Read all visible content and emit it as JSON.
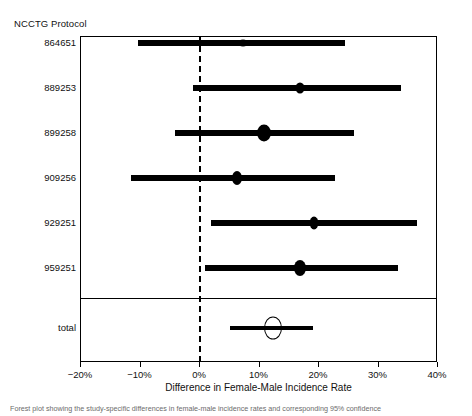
{
  "figure": {
    "column_header": "NCCTG Protocol",
    "x_axis_label": "Difference in Female-Male Incidence Rate",
    "caption": "Forest plot showing the study-specific differences in female-male incidence rates and corresponding 95% confidence"
  },
  "chart_data": {
    "type": "forest",
    "title": "",
    "xlabel": "Difference in Female-Male Incidence Rate",
    "ylabel": "NCCTG Protocol",
    "xlim": [
      -20,
      40
    ],
    "xticks": [
      -20,
      -10,
      0,
      10,
      20,
      30,
      40
    ],
    "xticklabels": [
      "−20%",
      "−10%",
      "0%",
      "10%",
      "20%",
      "30%",
      "40%"
    ],
    "reference_line": 0,
    "grid": false,
    "legend": "none",
    "units": "percent",
    "studies": [
      {
        "label": "864651",
        "estimate": 7.4,
        "ci_low": -10.2,
        "ci_high": 24.5,
        "marker": "filled-ellipse",
        "marker_width": 9,
        "marker_height": 7
      },
      {
        "label": "889253",
        "estimate": 17.0,
        "ci_low": -1.0,
        "ci_high": 34.0,
        "marker": "filled-ellipse",
        "marker_width": 9,
        "marker_height": 11
      },
      {
        "label": "899258",
        "estimate": 11.0,
        "ci_low": -4.0,
        "ci_high": 26.0,
        "marker": "filled-ellipse",
        "marker_width": 14,
        "marker_height": 17
      },
      {
        "label": "909256",
        "estimate": 6.4,
        "ci_low": -11.5,
        "ci_high": 22.8,
        "marker": "filled-ellipse",
        "marker_width": 10,
        "marker_height": 14
      },
      {
        "label": "929251",
        "estimate": 19.3,
        "ci_low": 2.0,
        "ci_high": 36.6,
        "marker": "filled-ellipse",
        "marker_width": 9,
        "marker_height": 13
      },
      {
        "label": "959251",
        "estimate": 17.0,
        "ci_low": 1.0,
        "ci_high": 33.4,
        "marker": "filled-ellipse",
        "marker_width": 12,
        "marker_height": 16
      }
    ],
    "summary": {
      "label": "total",
      "estimate": 12.4,
      "ci_low": 5.2,
      "ci_high": 19.2,
      "marker": "hollow-ellipse",
      "marker_width": 16,
      "marker_height": 21
    }
  }
}
